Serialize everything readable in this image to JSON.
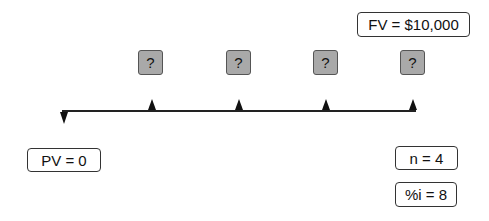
{
  "diagram": {
    "type": "cash-flow-timeline",
    "future_value_label": "FV = $10,000",
    "present_value_label": "PV = 0",
    "periods_label": "n = 4",
    "interest_label": "%i = 8",
    "payments": [
      {
        "period": 1,
        "label": "?"
      },
      {
        "period": 2,
        "label": "?"
      },
      {
        "period": 3,
        "label": "?"
      },
      {
        "period": 4,
        "label": "?"
      }
    ],
    "colors": {
      "payment_box_fill": "#a9a9a9",
      "line": "#222222",
      "box_border": "#333333"
    }
  }
}
